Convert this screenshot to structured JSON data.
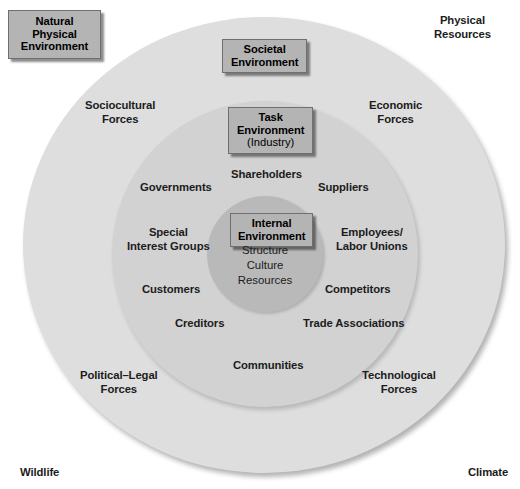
{
  "diagram": {
    "colors": {
      "outer_ring": "#dedede",
      "middle_ring": "#d2d2d2",
      "inner_ring": "#b9b9b9",
      "label_box": "#b4b4b4",
      "text": "#1c1c1c"
    },
    "boxes": {
      "natural_physical_environment": "Natural\nPhysical\nEnvironment",
      "natural_physical_environment_lines": [
        "Natural",
        "Physical",
        "Environment"
      ],
      "societal_environment": [
        "Societal",
        "Environment"
      ],
      "task_environment": [
        "Task",
        "Environment"
      ],
      "task_environment_sub": "(Industry)",
      "internal_environment": [
        "Internal",
        "Environment"
      ]
    },
    "internal_elements": [
      "Structure",
      "Culture",
      "Resources"
    ],
    "natural_physical_elements": [
      "Physical Resources",
      "Climate",
      "Wildlife"
    ],
    "outside_labels": {
      "physical_resources": [
        "Physical",
        "Resources"
      ],
      "wildlife": "Wildlife",
      "climate": "Climate"
    },
    "societal_forces": {
      "sociocultural": [
        "Sociocultural",
        "Forces"
      ],
      "economic": [
        "Economic",
        "Forces"
      ],
      "political_legal": [
        "Political–Legal",
        "Forces"
      ],
      "technological": [
        "Technological",
        "Forces"
      ]
    },
    "task_stakeholders": {
      "shareholders": "Shareholders",
      "governments": "Governments",
      "suppliers": "Suppliers",
      "special_interest_groups": [
        "Special",
        "Interest Groups"
      ],
      "employees_labor_unions": [
        "Employees/",
        "Labor Unions"
      ],
      "customers": "Customers",
      "competitors": "Competitors",
      "creditors": "Creditors",
      "trade_associations": "Trade Associations",
      "communities": "Communities"
    }
  }
}
